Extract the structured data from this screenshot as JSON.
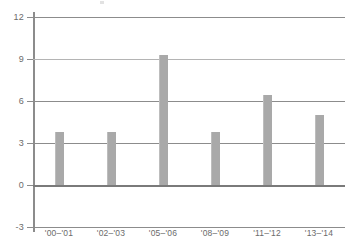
{
  "chart_data": {
    "type": "bar",
    "title": "",
    "subtitle": "",
    "xlabel": "",
    "ylabel": "",
    "categories": [
      "'00–'01",
      "'02–'03",
      "'05–'06",
      "'08–'09",
      "'11–'12",
      "'13–'14"
    ],
    "values": [
      3.8,
      3.8,
      9.3,
      3.8,
      6.4,
      5.0
    ],
    "ylim": [
      -3,
      12
    ],
    "yticks": [
      12,
      9,
      6,
      3,
      0,
      -3
    ],
    "ytick_labels": [
      "12",
      "9",
      "6",
      "3",
      "0",
      "-3"
    ],
    "grid": true,
    "grid_axis": "y",
    "legend": false,
    "legend_position": "none",
    "bar_color": "#a9a9a9",
    "gridline_color": "#8c8c8c",
    "axis_color": "#8c8c8c",
    "tick_label_color": "#6b6b6b",
    "background_color": "#ffffff",
    "series": [
      {
        "name": "",
        "values": [
          3.8,
          3.8,
          9.3,
          3.8,
          6.4,
          5.0
        ]
      }
    ],
    "points": [
      {
        "category": "'00–'01",
        "value": 3.8
      },
      {
        "category": "'02–'03",
        "value": 3.8
      },
      {
        "category": "'05–'06",
        "value": 9.3
      },
      {
        "category": "'08–'09",
        "value": 3.8
      },
      {
        "category": "'11–'12",
        "value": 6.4
      },
      {
        "category": "'13–'14",
        "value": 5.0
      }
    ]
  }
}
